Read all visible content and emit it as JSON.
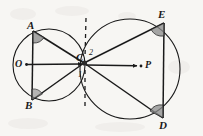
{
  "figure": {
    "background_color": "#f7f6f3",
    "stroke_color": "#1a1a1a",
    "angle_fill_color": "#8a8a8a",
    "labels": {
      "circle_left_center": "O",
      "circle_right_center": "P",
      "point_a": "A",
      "point_b": "B",
      "point_c": "C",
      "point_d": "D",
      "point_e": "E",
      "angle_1": "1",
      "angle_2": "2"
    },
    "geometry": {
      "circle_left": {
        "cx": 49,
        "cy": 65,
        "r": 36
      },
      "circle_right": {
        "cx": 130,
        "cy": 69,
        "r": 50
      },
      "tangent_point": {
        "x": 84,
        "y": 63
      },
      "center_left_marker": {
        "x": 26,
        "y": 64
      },
      "center_right_marker": {
        "x": 141,
        "y": 66
      },
      "point_a": {
        "x": 33,
        "y": 31
      },
      "point_b": {
        "x": 32,
        "y": 100
      },
      "point_d": {
        "x": 163,
        "y": 118
      },
      "point_e": {
        "x": 164,
        "y": 23
      },
      "dashed_line_x": 86,
      "dashed_line_top": 18,
      "dashed_line_bottom": 108
    },
    "segments": [
      "A-B",
      "A-C",
      "B-C",
      "O-arrow",
      "P-arrow",
      "C-E",
      "C-D",
      "E-D"
    ],
    "right_angle_marks": [
      "at-A",
      "at-B",
      "at-E",
      "at-D"
    ]
  }
}
